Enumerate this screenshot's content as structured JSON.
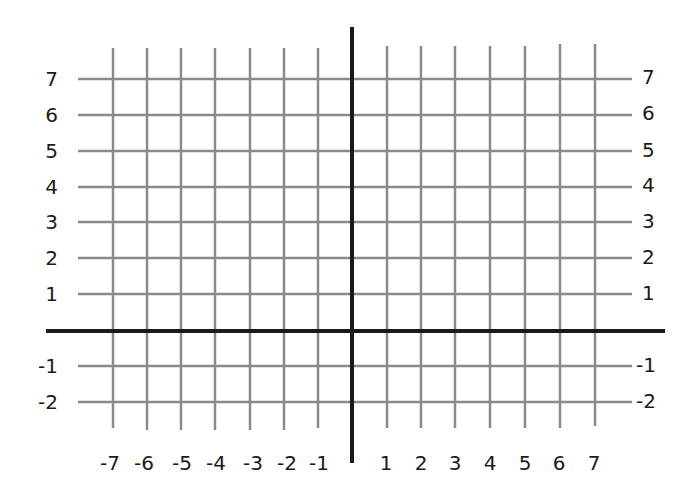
{
  "diagram": {
    "type": "coordinate-grid",
    "colors": {
      "gridline": "#8a8a8a",
      "axis": "#1a1a1a",
      "label": "#1a1a1a",
      "background": "#ffffff"
    },
    "x_axis": {
      "range": [
        -7,
        7
      ],
      "tick_labels": [
        "-7",
        "-6",
        "-5",
        "-4",
        "-3",
        "-2",
        "-1",
        "1",
        "2",
        "3",
        "4",
        "5",
        "6",
        "7"
      ]
    },
    "y_axis": {
      "range": [
        -2,
        7
      ],
      "tick_labels": [
        "7",
        "6",
        "5",
        "4",
        "3",
        "2",
        "1",
        "-1",
        "-2"
      ]
    }
  },
  "y_labels_left": [
    "7",
    "6",
    "5",
    "4",
    "3",
    "2",
    "1",
    "-1",
    "-2"
  ],
  "y_labels_right": [
    "7",
    "6",
    "5",
    "4",
    "3",
    "2",
    "1",
    "-1",
    "-2"
  ],
  "x_labels": [
    "-7",
    "-6",
    "-5",
    "-4",
    "-3",
    "-2",
    "-1",
    "1",
    "2",
    "3",
    "4",
    "5",
    "6",
    "7"
  ]
}
